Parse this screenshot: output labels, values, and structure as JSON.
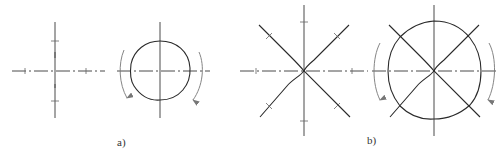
{
  "figure": {
    "labels": {
      "a": "a)",
      "b": "b)"
    },
    "colors": {
      "background": "#ffffff",
      "line": "#2a2a2a",
      "centerline": "#4a4a4a",
      "arrow": "#777777"
    },
    "panels": [
      {
        "id": "a",
        "description": "4-direction marking",
        "elements": [
          {
            "name": "cross-marking",
            "center": [
              55,
              71
            ],
            "directions": 4
          },
          {
            "name": "circle-contour",
            "center": [
              160,
              71
            ],
            "directions": 4,
            "rotation_arrows": 2
          }
        ]
      },
      {
        "id": "b",
        "description": "8-direction marking",
        "elements": [
          {
            "name": "star-marking",
            "center": [
              304,
              71
            ],
            "directions": 8
          },
          {
            "name": "circle-contour-with-star",
            "center": [
              434,
              71
            ],
            "directions": 8,
            "rotation_arrows": 2
          }
        ]
      }
    ]
  }
}
